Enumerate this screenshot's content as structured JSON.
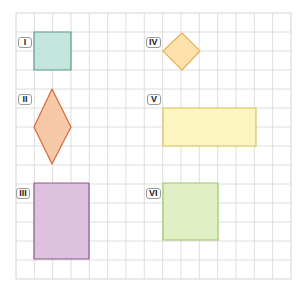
{
  "grid": {
    "x0": 16,
    "y0": 13,
    "cols": 15,
    "rows": 14,
    "cell_w": 18.33,
    "cell_h": 19.0,
    "line_color": "#d6d6d6",
    "border_color": "#c8c8c8"
  },
  "shapes": [
    {
      "id": "I",
      "label": "I",
      "kind": "square",
      "points": [
        [
          34,
          32
        ],
        [
          71,
          32
        ],
        [
          71,
          70
        ],
        [
          34,
          70
        ]
      ],
      "fill": "#c3e5dc",
      "stroke": "#5e9c8a",
      "label_pos": [
        18,
        37
      ]
    },
    {
      "id": "II",
      "label": "II",
      "kind": "rhombus",
      "points": [
        [
          52,
          89
        ],
        [
          71,
          127
        ],
        [
          52,
          164
        ],
        [
          34,
          127
        ]
      ],
      "fill": "#f7c9a8",
      "stroke": "#d9673a",
      "label_pos": [
        18,
        94
      ]
    },
    {
      "id": "III",
      "label": "III",
      "kind": "rectangle",
      "points": [
        [
          34,
          183
        ],
        [
          89,
          183
        ],
        [
          89,
          259
        ],
        [
          34,
          259
        ]
      ],
      "fill": "#ddc1df",
      "stroke": "#8c5a8a",
      "label_pos": [
        16,
        188
      ]
    },
    {
      "id": "IV",
      "label": "IV",
      "kind": "rotated-square",
      "points": [
        [
          182,
          33
        ],
        [
          200,
          51
        ],
        [
          182,
          70
        ],
        [
          163,
          51
        ]
      ],
      "fill": "#fde2ae",
      "stroke": "#e8b25a",
      "label_pos": [
        146,
        37
      ]
    },
    {
      "id": "V",
      "label": "V",
      "kind": "rectangle",
      "points": [
        [
          163,
          108
        ],
        [
          256,
          108
        ],
        [
          256,
          146
        ],
        [
          163,
          146
        ]
      ],
      "fill": "#fdf5bf",
      "stroke": "#d9c35a",
      "label_pos": [
        147,
        94
      ]
    },
    {
      "id": "VI",
      "label": "VI",
      "kind": "square",
      "points": [
        [
          163,
          183
        ],
        [
          218,
          183
        ],
        [
          218,
          240
        ],
        [
          163,
          240
        ]
      ],
      "fill": "#e0f0c4",
      "stroke": "#9cc86a",
      "label_pos": [
        146,
        188
      ]
    }
  ]
}
